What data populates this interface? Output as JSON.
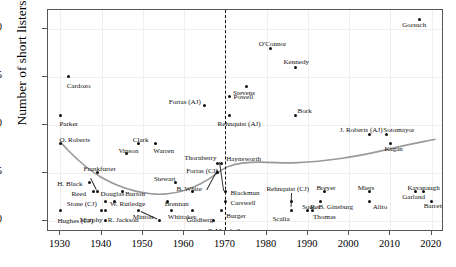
{
  "axes": {
    "ylabel": "Number of short listers",
    "yticks": [
      0,
      5,
      10,
      15,
      20
    ],
    "xticks": [
      1930,
      1940,
      1950,
      1960,
      1970,
      1980,
      1990,
      2000,
      2010,
      2020
    ],
    "xlim": [
      1927,
      2023
    ],
    "ylim": [
      -1.2,
      22
    ],
    "reference_line_year": 1970
  },
  "colors": {
    "point": "#111111",
    "trend": "#999999",
    "grid": "#f0eeee",
    "frame": "#555555",
    "text": "#111111"
  },
  "chart_data": {
    "type": "scatter",
    "title": "",
    "xlabel": "",
    "ylabel": "Number of short listers",
    "xlim": [
      1927,
      2023
    ],
    "ylim": [
      -1.2,
      22
    ],
    "grid": true,
    "legend": false,
    "annotations": [
      {
        "text": "dashed vertical reference line",
        "x": 1970
      }
    ],
    "series": [
      {
        "name": "Short listers",
        "points": [
          {
            "label": "Parker",
            "x": 1930,
            "y": 11,
            "lx": -1,
            "ly": 9,
            "anchor": "start"
          },
          {
            "label": "Cardozo",
            "x": 1932,
            "y": 15,
            "lx": -2,
            "ly": 9,
            "anchor": "start"
          },
          {
            "label": "O. Roberts",
            "x": 1930,
            "y": 8,
            "lx": -1,
            "ly": -4,
            "anchor": "start"
          },
          {
            "label": "H. Black",
            "x": 1937,
            "y": 4,
            "lx": -32,
            "ly": 2,
            "anchor": "start"
          },
          {
            "label": "Frankfurter",
            "x": 1939,
            "y": 5,
            "lx": -14,
            "ly": -4,
            "anchor": "start"
          },
          {
            "label": "Reed",
            "x": 1938,
            "y": 3,
            "lx": -22,
            "ly": 2,
            "anchor": "start"
          },
          {
            "label": "Stone (CJ)",
            "x": 1941,
            "y": 2,
            "lx": -39,
            "ly": 3,
            "anchor": "start"
          },
          {
            "label": "Hughes (CJ)",
            "x": 1930,
            "y": 1,
            "lx": -3,
            "ly": 10,
            "anchor": "start"
          },
          {
            "label": "Douglas",
            "x": 1939,
            "y": 3,
            "lx": 3,
            "ly": 2,
            "anchor": "start"
          },
          {
            "label": "Murphy",
            "x": 1940,
            "y": 1,
            "lx": -22,
            "ly": 9,
            "anchor": "start"
          },
          {
            "label": "Byrnes",
            "x": 1941,
            "y": 0,
            "lx": -10,
            "ly": 14,
            "anchor": "start"
          },
          {
            "label": "R. Jackson",
            "x": 1941,
            "y": 1,
            "lx": 2,
            "ly": 9,
            "anchor": "start"
          },
          {
            "label": "W. Rutledge",
            "x": 1943,
            "y": 2,
            "lx": -4,
            "ly": 3,
            "anchor": "start"
          },
          {
            "label": "Burton",
            "x": 1945,
            "y": 3,
            "lx": 3,
            "ly": 2,
            "anchor": "start"
          },
          {
            "label": "Vinson",
            "x": 1946,
            "y": 7,
            "lx": -8,
            "ly": -3,
            "anchor": "start"
          },
          {
            "label": "Clark",
            "x": 1949,
            "y": 8,
            "lx": -6,
            "ly": -4,
            "anchor": "start"
          },
          {
            "label": "Minton",
            "x": 1949,
            "y": 1,
            "lx": -6,
            "ly": 6,
            "anchor": "start"
          },
          {
            "label": "J. Harlan (II)",
            "x": 1954,
            "y": 0,
            "lx": -22,
            "ly": 14,
            "anchor": "start"
          },
          {
            "label": "Brennan",
            "x": 1956,
            "y": 2,
            "lx": -3,
            "ly": 3,
            "anchor": "start"
          },
          {
            "label": "Whittaker",
            "x": 1957,
            "y": 1,
            "lx": -4,
            "ly": 6,
            "anchor": "start"
          },
          {
            "label": "Stewart",
            "x": 1958,
            "y": 4,
            "lx": -22,
            "ly": -3,
            "anchor": "start"
          },
          {
            "label": "Warren",
            "x": 1953,
            "y": 8,
            "lx": -2,
            "ly": 7,
            "anchor": "start"
          },
          {
            "label": "B. White",
            "x": 1962,
            "y": 3,
            "lx": -16,
            "ly": -3,
            "anchor": "start"
          },
          {
            "label": "Goldberg",
            "x": 1962,
            "y": 1,
            "lx": -6,
            "ly": 9,
            "anchor": "start"
          },
          {
            "label": "Fortas (AJ)",
            "x": 1965,
            "y": 12,
            "lx": -36,
            "ly": -4,
            "anchor": "start"
          },
          {
            "label": "Fortas (CJ)",
            "x": 1968,
            "y": 5,
            "lx": -31,
            "ly": -2,
            "anchor": "start"
          },
          {
            "label": "Thornberry",
            "x": 1968,
            "y": 6,
            "lx": -33,
            "ly": -5,
            "anchor": "start"
          },
          {
            "label": "T. Marshall",
            "x": 1967,
            "y": 0,
            "lx": -5,
            "ly": 10,
            "anchor": "start"
          },
          {
            "label": "Haynsworth",
            "x": 1969,
            "y": 6,
            "lx": 5,
            "ly": -4,
            "anchor": "start"
          },
          {
            "label": "Carswell",
            "x": 1970,
            "y": 2,
            "lx": 5,
            "ly": 2,
            "anchor": "start"
          },
          {
            "label": "Blackmun",
            "x": 1970,
            "y": 3,
            "lx": 5,
            "ly": 1,
            "anchor": "start"
          },
          {
            "label": "Burger",
            "x": 1969,
            "y": 1,
            "lx": 5,
            "ly": 5,
            "anchor": "start"
          },
          {
            "label": "Rehnquist (AJ)",
            "x": 1971,
            "y": 11,
            "lx": -12,
            "ly": 9,
            "anchor": "start"
          },
          {
            "label": "Powell",
            "x": 1971,
            "y": 13,
            "lx": 4,
            "ly": 1,
            "anchor": "start"
          },
          {
            "label": "Stevens",
            "x": 1975,
            "y": 14,
            "lx": -13,
            "ly": 6,
            "anchor": "start"
          },
          {
            "label": "O'Connor",
            "x": 1981,
            "y": 18,
            "lx": -12,
            "ly": -4,
            "anchor": "start"
          },
          {
            "label": "Rehnquist (CJ)",
            "x": 1986,
            "y": 2,
            "lx": -25,
            "ly": -12,
            "anchor": "start"
          },
          {
            "label": "Scalia",
            "x": 1986,
            "y": 1,
            "lx": -19,
            "ly": 8,
            "anchor": "start"
          },
          {
            "label": "Bork",
            "x": 1987,
            "y": 11,
            "lx": 2,
            "ly": -4,
            "anchor": "start"
          },
          {
            "label": "Kennedy",
            "x": 1987,
            "y": 16,
            "lx": -12,
            "ly": -5,
            "anchor": "start"
          },
          {
            "label": "Souter",
            "x": 1990,
            "y": 1,
            "lx": -6,
            "ly": -4,
            "anchor": "start"
          },
          {
            "label": "Thomas",
            "x": 1991,
            "y": 1,
            "lx": 1,
            "ly": 6,
            "anchor": "start"
          },
          {
            "label": "Breyer",
            "x": 1994,
            "y": 3,
            "lx": -8,
            "ly": -4,
            "anchor": "start"
          },
          {
            "label": "R. B. Ginsburg",
            "x": 1993,
            "y": 2,
            "lx": -10,
            "ly": 6,
            "anchor": "start"
          },
          {
            "label": "Miers",
            "x": 2005,
            "y": 3,
            "lx": -12,
            "ly": -4,
            "anchor": "start"
          },
          {
            "label": "Alito",
            "x": 2005,
            "y": 2,
            "lx": 3,
            "ly": 6,
            "anchor": "start"
          },
          {
            "label": "J. Roberts (AJ)",
            "x": 2005,
            "y": 9,
            "lx": -30,
            "ly": -4,
            "anchor": "start"
          },
          {
            "label": "Sotomayor",
            "x": 2009,
            "y": 9,
            "lx": -3,
            "ly": -4,
            "anchor": "start"
          },
          {
            "label": "Kagan",
            "x": 2010,
            "y": 8,
            "lx": -6,
            "ly": 5,
            "anchor": "start"
          },
          {
            "label": "Garland",
            "x": 2016,
            "y": 3,
            "lx": -13,
            "ly": 5,
            "anchor": "start"
          },
          {
            "label": "Kavanaugh",
            "x": 2018,
            "y": 3,
            "lx": -16,
            "ly": -4,
            "anchor": "start"
          },
          {
            "label": "Barrett",
            "x": 2020,
            "y": 2,
            "lx": -8,
            "ly": 5,
            "anchor": "start"
          },
          {
            "label": "Gorsuch",
            "x": 2017,
            "y": 21,
            "lx": -17,
            "ly": 5,
            "anchor": "start"
          }
        ]
      }
    ],
    "trend_line": {
      "name": "smoothed trend",
      "color": "#999999",
      "points": [
        {
          "x": 1930,
          "y": 8.2
        },
        {
          "x": 1934,
          "y": 6.4
        },
        {
          "x": 1938,
          "y": 5.0
        },
        {
          "x": 1942,
          "y": 4.0
        },
        {
          "x": 1946,
          "y": 3.3
        },
        {
          "x": 1950,
          "y": 2.9
        },
        {
          "x": 1954,
          "y": 2.7
        },
        {
          "x": 1958,
          "y": 2.9
        },
        {
          "x": 1962,
          "y": 3.4
        },
        {
          "x": 1966,
          "y": 4.3
        },
        {
          "x": 1969,
          "y": 5.3
        },
        {
          "x": 1972,
          "y": 5.9
        },
        {
          "x": 1976,
          "y": 6.1
        },
        {
          "x": 1980,
          "y": 6.1
        },
        {
          "x": 1985,
          "y": 6.0
        },
        {
          "x": 1990,
          "y": 6.1
        },
        {
          "x": 1995,
          "y": 6.3
        },
        {
          "x": 2000,
          "y": 6.6
        },
        {
          "x": 2005,
          "y": 7.0
        },
        {
          "x": 2010,
          "y": 7.5
        },
        {
          "x": 2015,
          "y": 8.0
        },
        {
          "x": 2021,
          "y": 8.5
        }
      ]
    },
    "leader_lines": [
      {
        "from": {
          "x": 1937.4,
          "y": 4.4
        },
        "to": {
          "x": 1938.8,
          "y": 3.2
        }
      },
      {
        "from": {
          "x": 1986.2,
          "y": 2.9
        },
        "to": {
          "x": 1986.1,
          "y": 1.4
        }
      },
      {
        "from": {
          "x": 1949.6,
          "y": 1.0
        },
        "to": {
          "x": 1953.6,
          "y": 0.2
        }
      },
      {
        "from": {
          "x": 1968.2,
          "y": 5.3
        },
        "to": {
          "x": 1965.6,
          "y": 3.2
        }
      },
      {
        "from": {
          "x": 1968.6,
          "y": 6.1
        },
        "to": {
          "x": 1969.6,
          "y": 3.1
        }
      }
    ]
  }
}
